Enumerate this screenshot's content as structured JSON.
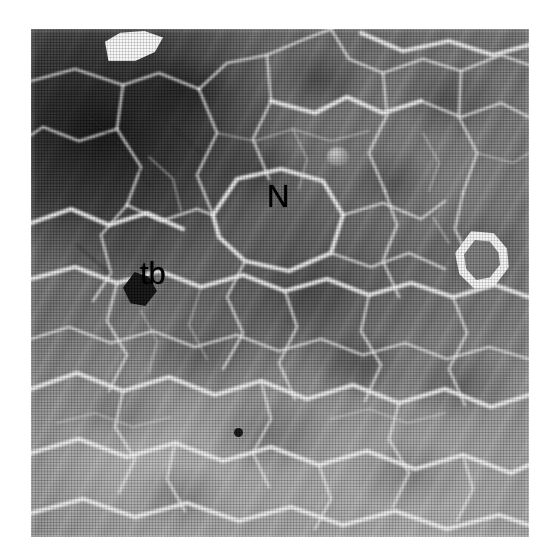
{
  "figure": {
    "kind": "sem-micrograph",
    "background_color": "#ffffff",
    "plate": {
      "left_px": 31,
      "top_px": 29,
      "width_px": 498,
      "height_px": 508,
      "tone": "grayscale",
      "texture": "halftone print raster",
      "dark_region": "upper-left",
      "bright_region": "lower-left and bottom"
    }
  },
  "annotations": [
    {
      "id": "N",
      "label": "N",
      "meaning": "nodule",
      "color": "#000000",
      "x_px": 236,
      "y_px": 152,
      "font_size_px": 31
    },
    {
      "id": "tb",
      "label": "tb",
      "meaning": "tear boundary",
      "color": "#000000",
      "x_px": 109,
      "y_px": 229,
      "font_size_px": 31
    }
  ],
  "features": [
    {
      "id": "bright-inclusion",
      "description": "bright angular inclusion at top edge",
      "color": "#fdfdfd",
      "x_px": 105,
      "y_px": 31
    },
    {
      "id": "bright-particle",
      "description": "bright-rimmed polygonal particle at right",
      "color": "#fafafa",
      "x_px": 455,
      "y_px": 231
    },
    {
      "id": "dark-pit",
      "description": "dark triangular pit adjacent to tb label",
      "color": "#090909",
      "x_px": 123,
      "y_px": 272
    },
    {
      "id": "small-void",
      "description": "small dark void near lower centre",
      "color": "#0c0c0c",
      "x_px": 234,
      "y_px": 428
    },
    {
      "id": "round-nodule",
      "description": "small rounded nodule upper centre-right",
      "color": "#a2a2a2",
      "x_px": 327,
      "y_px": 147
    }
  ],
  "boundary_network": {
    "stroke_color": "#f2f2f2",
    "description": "bright ridged grain boundaries forming irregular polygonal cells"
  }
}
